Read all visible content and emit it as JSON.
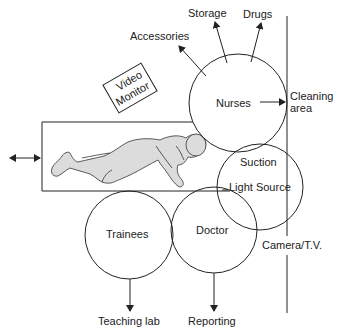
{
  "diagram": {
    "type": "endoscopy-room-layout",
    "zones": {
      "nurses": {
        "label": "Nurses"
      },
      "suction": {
        "label": "Suction"
      },
      "light_source": {
        "label": "Light Source"
      },
      "doctor": {
        "label": "Doctor"
      },
      "trainees": {
        "label": "Trainees"
      }
    },
    "equipment": {
      "video_monitor": {
        "line1": "Video",
        "line2": "Monitor"
      },
      "camera_tv": {
        "label": "Camera/T.V."
      }
    },
    "destinations": {
      "storage": "Storage",
      "drugs": "Drugs",
      "accessories": "Accessories",
      "cleaning_area_line1": "Cleaning",
      "cleaning_area_line2": "area",
      "teaching_lab": "Teaching lab",
      "reporting": "Reporting"
    },
    "patient": {
      "description": "patient-on-trolley"
    },
    "colors": {
      "line": "#222222",
      "patient_fill": "#dcdcdc",
      "background": "#ffffff"
    }
  }
}
